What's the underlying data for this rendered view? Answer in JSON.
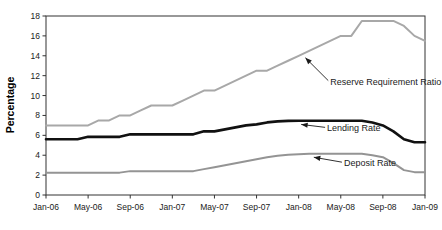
{
  "chart_data": {
    "type": "line",
    "title": "",
    "subtitle": "",
    "xlabel": "",
    "ylabel": "Percentage",
    "ylim": [
      0,
      18
    ],
    "xlim": [
      "Jan-06",
      "Jan-09"
    ],
    "grid": false,
    "legend_position": "inline-annotations",
    "y_ticks": [
      "0",
      "2",
      "4",
      "6",
      "8",
      "10",
      "12",
      "14",
      "16",
      "18"
    ],
    "y_tick_values": [
      0,
      2,
      4,
      6,
      8,
      10,
      12,
      14,
      16,
      18
    ],
    "x_ticks": [
      "Jan-06",
      "May-06",
      "Sep-06",
      "Jan-07",
      "May-07",
      "Sep-07",
      "Jan-08",
      "May-08",
      "Sep-08",
      "Jan-09"
    ],
    "x_tick_values": [
      0,
      4,
      8,
      12,
      16,
      20,
      24,
      28,
      32,
      36
    ],
    "x": [
      0,
      1,
      2,
      3,
      4,
      5,
      6,
      7,
      8,
      9,
      10,
      11,
      12,
      13,
      14,
      15,
      16,
      17,
      18,
      19,
      20,
      21,
      22,
      23,
      24,
      25,
      26,
      27,
      28,
      29,
      30,
      31,
      32,
      33,
      34,
      35,
      36
    ],
    "series": [
      {
        "name": "Reserve Requirement Ratio",
        "color": "#a8a8a8",
        "width": 2.0,
        "values": [
          7.0,
          7.0,
          7.0,
          7.0,
          7.0,
          7.5,
          7.5,
          8.0,
          8.0,
          8.5,
          9.0,
          9.0,
          9.0,
          9.5,
          10.0,
          10.5,
          10.5,
          11.0,
          11.5,
          12.0,
          12.5,
          12.5,
          13.0,
          13.5,
          14.0,
          14.5,
          15.0,
          15.5,
          16.0,
          16.0,
          17.5,
          17.5,
          17.5,
          17.5,
          17.0,
          16.0,
          15.5
        ]
      },
      {
        "name": "Lending Rate",
        "color": "#111111",
        "width": 2.6,
        "values": [
          5.6,
          5.6,
          5.6,
          5.6,
          5.85,
          5.85,
          5.85,
          5.85,
          6.1,
          6.1,
          6.1,
          6.1,
          6.1,
          6.1,
          6.1,
          6.4,
          6.4,
          6.6,
          6.8,
          7.0,
          7.1,
          7.3,
          7.4,
          7.45,
          7.47,
          7.47,
          7.47,
          7.47,
          7.47,
          7.47,
          7.47,
          7.3,
          7.0,
          6.4,
          5.6,
          5.3,
          5.3
        ]
      },
      {
        "name": "Deposit Rate",
        "color": "#949494",
        "width": 2.0,
        "values": [
          2.25,
          2.25,
          2.25,
          2.25,
          2.25,
          2.25,
          2.25,
          2.25,
          2.4,
          2.4,
          2.4,
          2.4,
          2.4,
          2.4,
          2.4,
          2.6,
          2.8,
          3.0,
          3.2,
          3.4,
          3.6,
          3.8,
          3.95,
          4.05,
          4.1,
          4.14,
          4.14,
          4.14,
          4.14,
          4.14,
          4.14,
          4.0,
          3.8,
          3.2,
          2.5,
          2.3,
          2.3
        ]
      }
    ],
    "annotations": [
      {
        "text": "Reserve Requirement Ratio",
        "target_x": 24.4,
        "target_y": 14.3,
        "label_x": 27.0,
        "label_y": 11.1
      },
      {
        "text": "Lending Rate",
        "target_x": 24.0,
        "target_y": 7.6,
        "label_x": 26.7,
        "label_y": 6.4
      },
      {
        "text": "Deposit Rate",
        "target_x": 25.2,
        "target_y": 4.3,
        "label_x": 28.3,
        "label_y": 2.9
      }
    ]
  }
}
